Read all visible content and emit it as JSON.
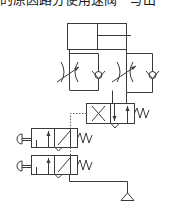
{
  "caption": "的原因路分使用速阀一写出",
  "diagram": {
    "type": "pneumatic-circuit",
    "components": [
      {
        "id": "cylinder",
        "kind": "double-acting-cylinder"
      },
      {
        "id": "flow-control-left",
        "kind": "one-way-flow-control-valve"
      },
      {
        "id": "flow-control-right",
        "kind": "one-way-flow-control-valve"
      },
      {
        "id": "main-valve",
        "kind": "4/2-directional-valve-pilot-spring"
      },
      {
        "id": "manual-valve-top",
        "kind": "3/2-push-button-valve-spring-return"
      },
      {
        "id": "manual-valve-bottom",
        "kind": "3/2-push-button-valve-spring-return"
      },
      {
        "id": "air-source",
        "kind": "pressure-source"
      }
    ],
    "colors": {
      "line": "#3a3a3a",
      "background": "#ffffff"
    }
  }
}
